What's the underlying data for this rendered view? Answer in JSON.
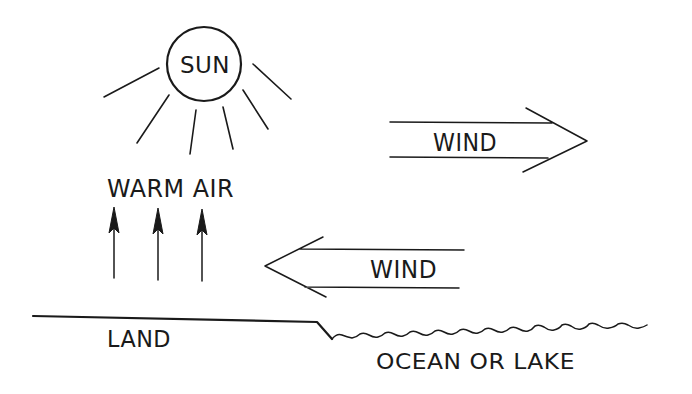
{
  "diagram": {
    "colors": {
      "ink": "#1a1a1a",
      "background": "#ffffff"
    },
    "sun": {
      "label": "SUN",
      "center": [
        204,
        64
      ],
      "radius": 37,
      "rays": 6
    },
    "warm_air": {
      "label": "WARM AIR",
      "arrow_count": 3,
      "arrow_direction": "up"
    },
    "upper_wind": {
      "label": "WIND",
      "direction": "right",
      "location": "aloft, over land toward water"
    },
    "lower_wind": {
      "label": "WIND",
      "direction": "left",
      "location": "near surface, from water toward land"
    },
    "land": {
      "label": "LAND"
    },
    "water": {
      "label": "OCEAN OR LAKE"
    }
  }
}
